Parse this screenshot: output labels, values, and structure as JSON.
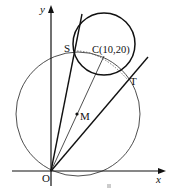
{
  "figure": {
    "axes": {
      "x_label": "x",
      "y_label": "y",
      "origin_label": "O"
    },
    "points": {
      "S": {
        "label": "S"
      },
      "T": {
        "label": "T"
      },
      "C": {
        "label": "C(10,20)",
        "coords": [
          10,
          20
        ]
      },
      "M": {
        "label": "M"
      }
    },
    "circles": [
      {
        "name": "circle-C",
        "center": "C",
        "style": "bold"
      },
      {
        "name": "circle-M",
        "center": "M",
        "style": "thin",
        "passes_through": [
          "O",
          "S",
          "C",
          "T"
        ]
      }
    ],
    "lines": [
      {
        "name": "tangent-OS",
        "from": "O",
        "through": "S"
      },
      {
        "name": "tangent-OT",
        "from": "O",
        "through": "T"
      },
      {
        "name": "segment-OC",
        "from": "O",
        "to": "C"
      }
    ],
    "arc": {
      "name": "chord-arc-ST",
      "style": "dotted"
    },
    "colors": {
      "stroke": "#111111",
      "background": "#ffffff",
      "watermark": "#cccccc"
    }
  }
}
